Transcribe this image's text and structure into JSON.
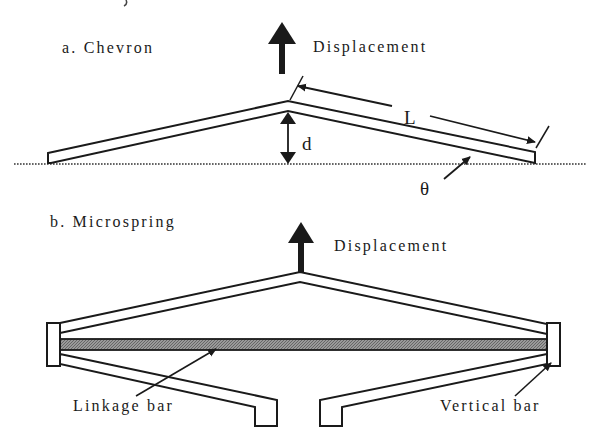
{
  "figure": {
    "panel_a": {
      "title": "a. Chevron",
      "displacement_label": "Displacement",
      "length_label": "L",
      "height_label": "d",
      "angle_label": "θ"
    },
    "panel_b": {
      "title": "b. Microspring",
      "displacement_label": "Displacement",
      "linkage_bar_label": "Linkage bar",
      "vertical_bar_label": "Vertical bar"
    },
    "colors": {
      "stroke": "#1a1a1a",
      "linkage_fill": "#8a8a8a",
      "background": "#ffffff"
    }
  }
}
